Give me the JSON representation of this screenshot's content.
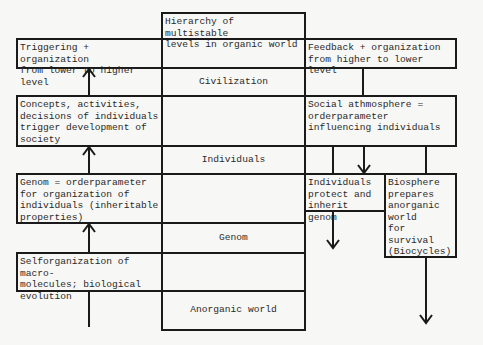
{
  "hierarchy": {
    "title": "Hierarchy of multistable\nlevels in organic world",
    "levels": [
      "Civilization",
      "Individuals",
      "Genom",
      "Anorganic world"
    ]
  },
  "left_column": {
    "header": "Triggering + organization\nfrom lower to higher level",
    "boxes": [
      "Concepts, activities,\ndecisions of individuals\ntrigger development of\nsociety",
      "Genom = orderparameter\nfor organization of\nindividuals (inheritable\nproperties)",
      "Selforganization of macro-\nmolecules; biological\nevolution"
    ]
  },
  "right_column": {
    "header": "Feedback + organization\nfrom higher to lower level",
    "social": "Social athmosphere =\norderparameter\ninfluencing individuals",
    "individuals_box": "Individuals\nprotect and\ninherit genom",
    "biosphere_box": "Biosphere\nprepares\nanorganic world\nfor survival\n(Biocycles)"
  }
}
